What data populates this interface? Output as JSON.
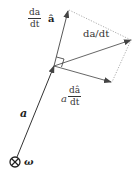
{
  "diagram": {
    "labels": {
      "dadt_ahat": {
        "num": "da",
        "den": "dt",
        "suffix": "â"
      },
      "da_dt_vec": "da/dt",
      "a_dahat": {
        "prefix": "a",
        "num": "dâ",
        "den": "dt"
      },
      "a_vec": "a",
      "omega": "ω"
    },
    "colors": {
      "line": "#333333",
      "dotted": "#999999",
      "circle": "#222222"
    }
  }
}
